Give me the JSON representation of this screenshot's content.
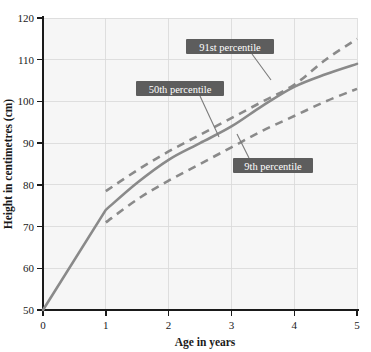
{
  "chart_data": {
    "type": "line",
    "title": "",
    "xlabel": "Age in years",
    "ylabel": "Height in centimetres (cm)",
    "xlim": [
      0,
      5
    ],
    "ylim": [
      50,
      120
    ],
    "xticks": [
      "0",
      "1",
      "2",
      "3",
      "4",
      "5"
    ],
    "yticks": [
      "50",
      "60",
      "70",
      "80",
      "90",
      "100",
      "110",
      "120"
    ],
    "grid": true,
    "legend_position": "inline-callouts",
    "x": [
      0,
      1,
      2,
      3,
      4,
      5
    ],
    "series": [
      {
        "name": "91st percentile",
        "style": "dashed",
        "color": "#8a8a8a",
        "x": [
          1,
          1.5,
          2,
          2.5,
          3,
          3.5,
          4,
          4.5,
          5
        ],
        "values": [
          78.5,
          83.5,
          88.0,
          92.0,
          96.0,
          100.0,
          104.0,
          110.0,
          115.0
        ]
      },
      {
        "name": "50th percentile",
        "style": "solid",
        "color": "#8a8a8a",
        "x": [
          0,
          1,
          1.5,
          2,
          2.5,
          3,
          3.5,
          4,
          4.5,
          5
        ],
        "values": [
          50.0,
          74.0,
          80.5,
          86.0,
          90.0,
          94.0,
          99.0,
          103.5,
          106.5,
          109.0
        ]
      },
      {
        "name": "9th percentile",
        "style": "dashed",
        "color": "#8a8a8a",
        "x": [
          1,
          1.5,
          2,
          2.5,
          3,
          3.5,
          4,
          4.5,
          5
        ],
        "values": [
          71.0,
          76.5,
          81.0,
          85.0,
          89.0,
          93.0,
          96.5,
          100.0,
          103.0
        ]
      }
    ],
    "annotations": [
      {
        "label": "91st percentile",
        "box_x": 186,
        "box_y": 39,
        "box_w": 88,
        "box_h": 15,
        "leader": "M 252 54 L 271 80"
      },
      {
        "label": "50th percentile",
        "box_x": 136,
        "box_y": 81,
        "box_w": 88,
        "box_h": 15,
        "leader": "M 200 96 L 219 137"
      },
      {
        "label": "9th percentile",
        "box_x": 233,
        "box_y": 158,
        "box_w": 80,
        "box_h": 15,
        "leader": "M 249 158 L 237 134"
      }
    ],
    "colors": {
      "line": "#8a8a8a",
      "callout_box": "#5d5d5d",
      "callout_text": "#ffffff",
      "axis": "#1a1a1a",
      "gridline": "#d8d8d8",
      "plot_background": "#f6f6f6",
      "page_background": "#ffffff"
    }
  }
}
